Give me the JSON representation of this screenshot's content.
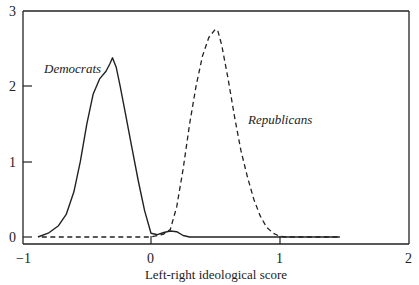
{
  "chart_data": {
    "type": "line",
    "title": "",
    "xlabel": "Left-right ideological score",
    "ylabel": "",
    "xlim": [
      -1,
      2
    ],
    "ylim": [
      -0.09,
      3
    ],
    "grid": false,
    "legend": "inline labels",
    "xticks": [
      -1,
      0,
      1,
      2
    ],
    "xtick_labels": [
      "−1",
      "0",
      "1",
      "2"
    ],
    "yticks": [
      0,
      1,
      2,
      3
    ],
    "ytick_labels": [
      "0",
      "1",
      "2",
      "3"
    ],
    "series": [
      {
        "name": "Democrats",
        "style": "solid",
        "label_pos": [
          -0.75,
          2.28
        ],
        "x": [
          -0.88,
          -0.8,
          -0.72,
          -0.66,
          -0.6,
          -0.55,
          -0.5,
          -0.45,
          -0.4,
          -0.35,
          -0.32,
          -0.3,
          -0.27,
          -0.24,
          -0.2,
          -0.15,
          -0.1,
          -0.05,
          0.0,
          0.05,
          0.1,
          0.15,
          0.2,
          0.25,
          0.3,
          0.4,
          0.6,
          0.8,
          1.0,
          1.2,
          1.47
        ],
        "y": [
          0.0,
          0.05,
          0.15,
          0.3,
          0.6,
          1.0,
          1.5,
          1.9,
          2.1,
          2.2,
          2.3,
          2.38,
          2.25,
          2.0,
          1.65,
          1.2,
          0.75,
          0.35,
          0.05,
          0.03,
          0.06,
          0.08,
          0.07,
          0.02,
          0.0,
          0.0,
          0.0,
          0.0,
          0.0,
          0.0,
          0.0
        ]
      },
      {
        "name": "Republicans",
        "style": "dashed",
        "label_pos": [
          0.73,
          1.55
        ],
        "x": [
          -0.85,
          -0.5,
          -0.2,
          0.0,
          0.1,
          0.15,
          0.2,
          0.25,
          0.3,
          0.35,
          0.4,
          0.45,
          0.5,
          0.52,
          0.55,
          0.6,
          0.65,
          0.7,
          0.75,
          0.8,
          0.85,
          0.9,
          0.95,
          1.0,
          1.05,
          1.2,
          1.47
        ],
        "y": [
          0.0,
          0.0,
          0.0,
          0.0,
          0.04,
          0.1,
          0.4,
          0.9,
          1.5,
          2.0,
          2.4,
          2.65,
          2.76,
          2.74,
          2.55,
          2.1,
          1.6,
          1.15,
          0.8,
          0.5,
          0.28,
          0.13,
          0.05,
          0.01,
          0.0,
          0.0,
          0.0
        ]
      }
    ]
  },
  "labels": {
    "democrats": "Democrats",
    "republicans": "Republicans",
    "xaxis_title": "Left-right ideological score",
    "xtick_m1": "−1",
    "xtick_0": "0",
    "xtick_1": "1",
    "xtick_2": "2",
    "ytick_0": "0",
    "ytick_1": "1",
    "ytick_2": "2",
    "ytick_3": "3"
  }
}
